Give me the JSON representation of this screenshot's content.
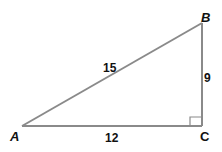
{
  "diagram": {
    "type": "right-triangle",
    "line_color": "#8a8a8a",
    "vertices": [
      {
        "name": "A",
        "x": 22,
        "y": 126,
        "label": "A"
      },
      {
        "name": "B",
        "x": 202,
        "y": 23,
        "label": "B"
      },
      {
        "name": "C",
        "x": 202,
        "y": 126,
        "label": "C"
      }
    ],
    "sides": [
      {
        "between": "AB",
        "label": "15"
      },
      {
        "between": "AC",
        "label": "12"
      },
      {
        "between": "BC",
        "label": "9"
      }
    ],
    "right_angle_at": "C"
  }
}
